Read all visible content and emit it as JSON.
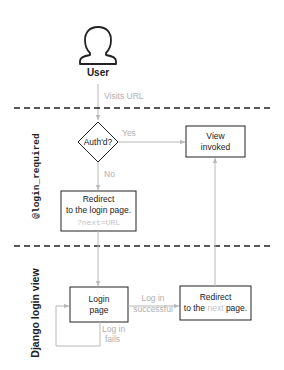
{
  "diagram": {
    "actor": {
      "label": "User",
      "icon": "user-silhouette-icon"
    },
    "lanes": [
      {
        "label": "@login_required",
        "font": "mono"
      },
      {
        "label": "Django login view",
        "font": "sans-bold"
      }
    ],
    "nodes": {
      "decision": {
        "label": "Auth'd?"
      },
      "view_invoked": {
        "line1": "View",
        "line2": "invoked"
      },
      "redirect_login": {
        "line1": "Redirect",
        "line2": "to the login page.",
        "line3": "?next=URL"
      },
      "login_page": {
        "line1": "Login",
        "line2": "page"
      },
      "redirect_next": {
        "line1": "Redirect",
        "line2_pre": "to the ",
        "line2_code": "next",
        "line2_post": " page."
      }
    },
    "edges": {
      "visits_url": "Visits URL",
      "yes": "Yes",
      "no": "No",
      "login_success_1": "Log in",
      "login_success_2": "successful",
      "login_fail_1": "Log in",
      "login_fail_2": "fails"
    },
    "colors": {
      "stroke": "#333333",
      "edge": "#b8b8b8",
      "edge_label": "#b0b0b0",
      "text": "#222222"
    }
  }
}
